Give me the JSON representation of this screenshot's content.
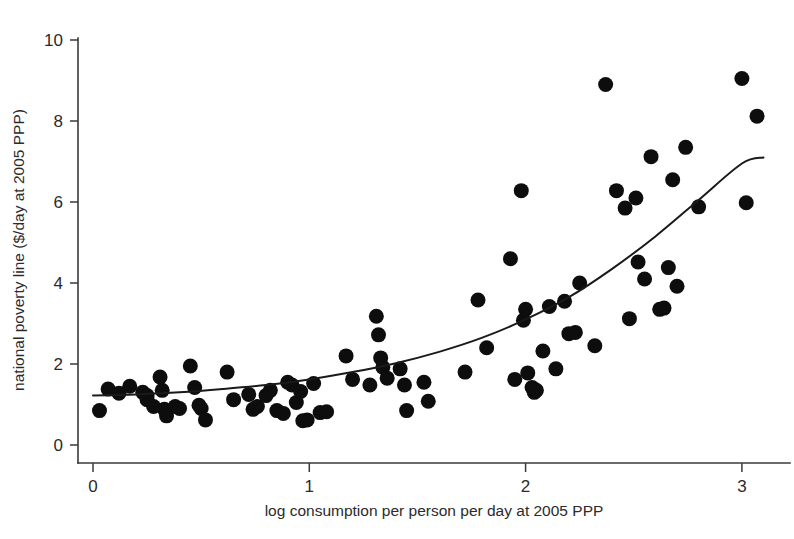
{
  "chart_data": {
    "type": "scatter",
    "title": "",
    "subtitle": "",
    "xlabel": "log consumption per person per day at 2005 PPP",
    "ylabel": "national poverty line ($/day at 2005 PPP)",
    "xlim": [
      -0.05,
      3.2
    ],
    "ylim": [
      0,
      10.6
    ],
    "xticks": [
      0,
      1,
      2,
      3
    ],
    "xtick_labels": [
      "0",
      "1",
      "2",
      "3"
    ],
    "yticks": [
      0,
      2,
      4,
      6,
      8,
      10
    ],
    "ytick_labels": [
      "0",
      "2",
      "4",
      "6",
      "8",
      "10"
    ],
    "grid": false,
    "legend": false,
    "legend_position": "none",
    "marker_color": "#0d0d0d",
    "marker_size": 7.5,
    "line_color": "#1a1a1a",
    "series": [
      {
        "name": "countries",
        "type": "scatter",
        "points": [
          [
            0.03,
            0.85
          ],
          [
            0.07,
            1.38
          ],
          [
            0.12,
            1.28
          ],
          [
            0.17,
            1.45
          ],
          [
            0.23,
            1.3
          ],
          [
            0.25,
            1.22
          ],
          [
            0.25,
            1.12
          ],
          [
            0.28,
            0.95
          ],
          [
            0.31,
            1.68
          ],
          [
            0.32,
            1.35
          ],
          [
            0.33,
            0.88
          ],
          [
            0.34,
            0.72
          ],
          [
            0.38,
            0.95
          ],
          [
            0.4,
            0.9
          ],
          [
            0.45,
            1.95
          ],
          [
            0.47,
            1.42
          ],
          [
            0.49,
            0.98
          ],
          [
            0.5,
            0.9
          ],
          [
            0.52,
            0.62
          ],
          [
            0.62,
            1.8
          ],
          [
            0.65,
            1.12
          ],
          [
            0.72,
            1.25
          ],
          [
            0.74,
            0.88
          ],
          [
            0.76,
            0.95
          ],
          [
            0.8,
            1.22
          ],
          [
            0.82,
            1.35
          ],
          [
            0.85,
            0.85
          ],
          [
            0.88,
            0.78
          ],
          [
            0.9,
            1.55
          ],
          [
            0.92,
            1.48
          ],
          [
            0.94,
            1.05
          ],
          [
            0.96,
            1.32
          ],
          [
            0.97,
            0.6
          ],
          [
            0.99,
            0.62
          ],
          [
            1.02,
            1.52
          ],
          [
            1.05,
            0.8
          ],
          [
            1.08,
            0.82
          ],
          [
            1.17,
            2.2
          ],
          [
            1.2,
            1.62
          ],
          [
            1.28,
            1.48
          ],
          [
            1.31,
            3.18
          ],
          [
            1.32,
            2.72
          ],
          [
            1.33,
            2.15
          ],
          [
            1.34,
            1.92
          ],
          [
            1.36,
            1.65
          ],
          [
            1.42,
            1.88
          ],
          [
            1.44,
            1.48
          ],
          [
            1.45,
            0.85
          ],
          [
            1.53,
            1.55
          ],
          [
            1.55,
            1.08
          ],
          [
            1.72,
            1.8
          ],
          [
            1.78,
            3.58
          ],
          [
            1.82,
            2.4
          ],
          [
            1.93,
            4.6
          ],
          [
            1.95,
            1.62
          ],
          [
            1.98,
            6.28
          ],
          [
            1.99,
            3.08
          ],
          [
            2.0,
            3.35
          ],
          [
            2.01,
            1.78
          ],
          [
            2.03,
            1.42
          ],
          [
            2.04,
            1.3
          ],
          [
            2.05,
            1.35
          ],
          [
            2.08,
            2.32
          ],
          [
            2.11,
            3.42
          ],
          [
            2.14,
            1.88
          ],
          [
            2.18,
            3.55
          ],
          [
            2.2,
            2.75
          ],
          [
            2.23,
            2.78
          ],
          [
            2.25,
            4.0
          ],
          [
            2.32,
            2.45
          ],
          [
            2.37,
            8.9
          ],
          [
            2.42,
            6.28
          ],
          [
            2.46,
            5.85
          ],
          [
            2.48,
            3.12
          ],
          [
            2.51,
            6.1
          ],
          [
            2.52,
            4.52
          ],
          [
            2.55,
            4.1
          ],
          [
            2.58,
            7.12
          ],
          [
            2.62,
            3.35
          ],
          [
            2.64,
            3.38
          ],
          [
            2.66,
            4.38
          ],
          [
            2.68,
            6.55
          ],
          [
            2.7,
            3.92
          ],
          [
            2.74,
            7.35
          ],
          [
            2.8,
            5.88
          ],
          [
            3.0,
            9.05
          ],
          [
            3.02,
            5.98
          ],
          [
            3.07,
            8.12
          ]
        ]
      },
      {
        "name": "fitted-curve",
        "type": "line",
        "points": [
          [
            0.0,
            1.22
          ],
          [
            0.2,
            1.25
          ],
          [
            0.4,
            1.3
          ],
          [
            0.6,
            1.38
          ],
          [
            0.8,
            1.48
          ],
          [
            1.0,
            1.62
          ],
          [
            1.2,
            1.8
          ],
          [
            1.4,
            2.02
          ],
          [
            1.6,
            2.3
          ],
          [
            1.8,
            2.65
          ],
          [
            2.0,
            3.1
          ],
          [
            2.2,
            3.65
          ],
          [
            2.4,
            4.35
          ],
          [
            2.6,
            5.15
          ],
          [
            2.8,
            6.05
          ],
          [
            3.0,
            6.95
          ],
          [
            3.1,
            7.1
          ]
        ]
      }
    ]
  }
}
